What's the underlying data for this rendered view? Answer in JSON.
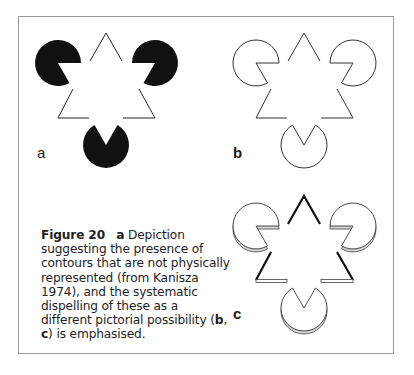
{
  "figure": {
    "number_label": "Figure 20",
    "panels": [
      {
        "id": "a",
        "label": "a",
        "style": "filled"
      },
      {
        "id": "b",
        "label": "b",
        "style": "outline"
      },
      {
        "id": "c",
        "label": "c",
        "style": "3d-outline"
      }
    ]
  },
  "caption": {
    "lead_label": "Figure 20",
    "part_a": "a",
    "text_1": " Depiction suggesting the presence of contours that are not physically represented (from Kanisza 1974), and the systematic dispelling of these as a different pictorial possibility (",
    "ref_b": "b",
    "sep": ", ",
    "ref_c": "c",
    "text_2": ") is emphasised."
  }
}
